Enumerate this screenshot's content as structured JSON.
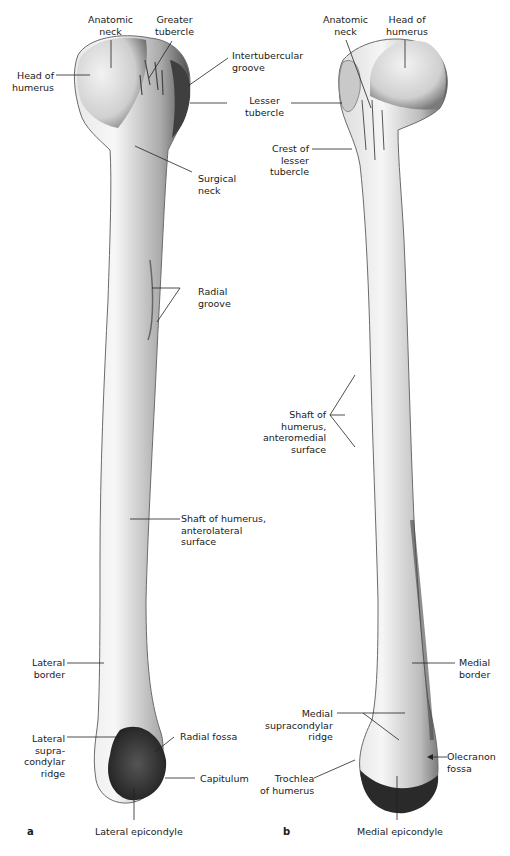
{
  "figure": {
    "panel_a": {
      "letter": "a",
      "labels": {
        "anatomic_neck": "Anatomic\nneck",
        "greater_tubercle": "Greater\ntubercle",
        "head_of_humerus": "Head of\nhumerus",
        "intertubercular_groove": "Intertubercular\ngroove",
        "lesser_tubercle": "Lesser\ntubercle",
        "surgical_neck": "Surgical\nneck",
        "radial_groove": "Radial\ngroove",
        "shaft": "Shaft of humerus,\nanterolateral\nsurface",
        "lateral_border": "Lateral\nborder",
        "lateral_supracondylar_ridge": "Lateral\nsupra-\ncondylar\nridge",
        "radial_fossa": "Radial fossa",
        "capitulum": "Capitulum",
        "lateral_epicondyle": "Lateral epicondyle"
      }
    },
    "panel_b": {
      "letter": "b",
      "labels": {
        "anatomic_neck": "Anatomic\nneck",
        "head_of_humerus": "Head of\nhumerus",
        "crest_of_lesser_tubercle": "Crest of\nlesser\ntubercle",
        "shaft": "Shaft of\nhumerus,\nanteromedial\nsurface",
        "medial_border": "Medial\nborder",
        "medial_supracondylar_ridge": "Medial\nsupracondylar\nridge",
        "olecranon_fossa": "Olecranon\nfossa",
        "trochlea": "Trochlea\nof humerus",
        "medial_epicondyle": "Medial epicondyle"
      }
    }
  }
}
